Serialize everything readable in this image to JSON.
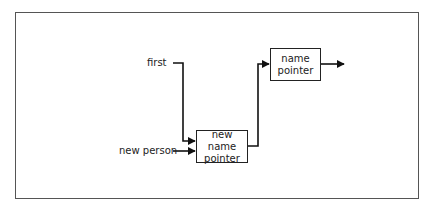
{
  "diagram": {
    "type": "flow",
    "inputs": {
      "first": "first",
      "new_person": "new person"
    },
    "nodes": {
      "new_name_pointer": {
        "line1": "new name",
        "line2": "pointer"
      },
      "name_pointer": {
        "line1": "name",
        "line2": "pointer"
      }
    },
    "edges": [
      {
        "from": "first",
        "to": "new name pointer"
      },
      {
        "from": "new person",
        "to": "new name pointer"
      },
      {
        "from": "new name pointer",
        "to": "name pointer"
      },
      {
        "from": "name pointer",
        "to": "output"
      }
    ],
    "colors": {
      "line": "#111111",
      "frame": "#555555",
      "text": "#222222"
    }
  }
}
